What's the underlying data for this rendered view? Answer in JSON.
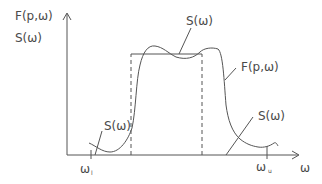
{
  "diagram": {
    "y_axis_labels": [
      "F(p,ω)",
      "S(ω)"
    ],
    "x_axis_label": "ω",
    "curve_labels": {
      "s_top": "S(ω)",
      "f_right": "F(p,ω)",
      "s_left": "S(ω)",
      "s_right": "S(ω)"
    },
    "x_markers": {
      "lower": {
        "main": "ω",
        "sub": "l"
      },
      "upper": {
        "main": "ω",
        "sub": "u"
      }
    },
    "colors": {
      "stroke": "#555555",
      "text": "#4a4a4a",
      "background": "#ffffff"
    }
  }
}
